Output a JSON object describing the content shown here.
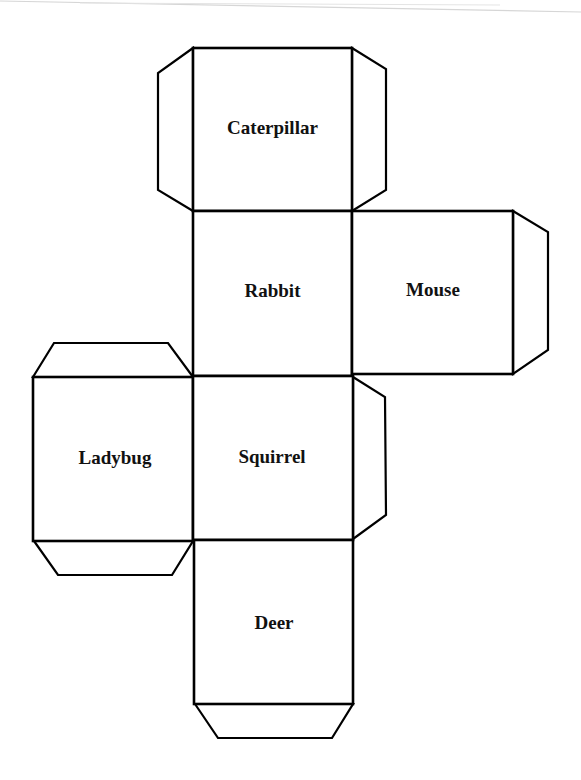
{
  "document": {
    "type": "cube-net-printable",
    "stroke_color": "#000000",
    "background_color": "#ffffff",
    "faces": [
      {
        "id": "caterpillar",
        "label": "Caterpillar",
        "x": 193,
        "y": 48,
        "w": 159,
        "h": 163
      },
      {
        "id": "rabbit",
        "label": "Rabbit",
        "x": 193,
        "y": 211,
        "w": 159,
        "h": 165
      },
      {
        "id": "mouse",
        "label": "Mouse",
        "x": 352,
        "y": 211,
        "w": 161,
        "h": 163
      },
      {
        "id": "ladybug",
        "label": "Ladybug",
        "x": 33,
        "y": 377,
        "w": 160,
        "h": 164
      },
      {
        "id": "squirrel",
        "label": "Squirrel",
        "x": 193,
        "y": 376,
        "w": 160,
        "h": 164
      },
      {
        "id": "deer",
        "label": "Deer",
        "x": 194,
        "y": 540,
        "w": 159,
        "h": 164
      }
    ],
    "tabs": [
      {
        "id": "caterpillar-left-tab",
        "points": "193,48 158,73 158,190 193,211"
      },
      {
        "id": "caterpillar-right-tab",
        "points": "352,48 386,69 386,190 352,211"
      },
      {
        "id": "mouse-right-tab",
        "points": "513,211 548,232 548,350 513,374"
      },
      {
        "id": "ladybug-top-tab",
        "points": "33,377 54,343 168,343 193,377"
      },
      {
        "id": "ladybug-bottom-tab",
        "points": "34,541 58,575 172,575 193,541"
      },
      {
        "id": "squirrel-right-tab",
        "points": "353,377 385,397 386,515 353,539"
      },
      {
        "id": "deer-bottom-tab",
        "points": "195,704 218,738 332,738 353,704"
      }
    ]
  }
}
